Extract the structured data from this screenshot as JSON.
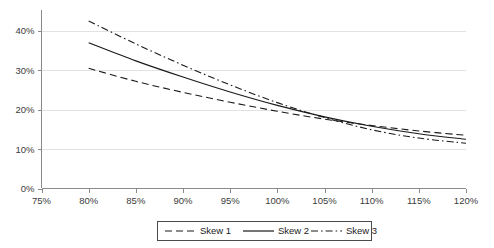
{
  "chart_data": {
    "type": "line",
    "title": "",
    "subtitle": "",
    "xlabel": "",
    "ylabel": "",
    "xlim": [
      75,
      120
    ],
    "ylim": [
      0,
      45
    ],
    "grid": true,
    "legend_position": "bottom",
    "x_tick_labels": [
      "75%",
      "80%",
      "85%",
      "90%",
      "95%",
      "100%",
      "105%",
      "110%",
      "115%",
      "120%"
    ],
    "x_ticks": [
      75,
      80,
      85,
      90,
      95,
      100,
      105,
      110,
      115,
      120
    ],
    "y_tick_labels": [
      "0%",
      "10%",
      "20%",
      "30%",
      "40%"
    ],
    "y_ticks": [
      0,
      10,
      20,
      30,
      40
    ],
    "x": [
      80,
      85,
      90,
      95,
      100,
      105,
      110,
      115,
      120
    ],
    "series": [
      {
        "name": "Skew 1",
        "style": "dashed",
        "color": "#1a1a1a",
        "values": [
          30.5,
          27.2,
          24.4,
          21.9,
          19.6,
          17.6,
          16.0,
          14.6,
          13.5
        ]
      },
      {
        "name": "Skew 2",
        "style": "solid",
        "color": "#1a1a1a",
        "values": [
          37.0,
          32.4,
          28.3,
          24.5,
          21.1,
          18.2,
          15.8,
          13.9,
          12.5
        ]
      },
      {
        "name": "Skew 3",
        "style": "dash-dot",
        "color": "#1a1a1a",
        "values": [
          42.5,
          36.7,
          31.3,
          26.3,
          21.8,
          18.0,
          14.9,
          12.8,
          11.5
        ]
      }
    ],
    "legend_entries": [
      {
        "label": "Skew 1",
        "style": "dashed"
      },
      {
        "label": "Skew 2",
        "style": "solid"
      },
      {
        "label": "Skew 3",
        "style": "dash-dot"
      }
    ]
  },
  "axis": {
    "x_labels": [
      "75%",
      "80%",
      "85%",
      "90%",
      "95%",
      "100%",
      "105%",
      "110%",
      "115%",
      "120%"
    ],
    "y_labels": [
      "0%",
      "10%",
      "20%",
      "30%",
      "40%"
    ]
  },
  "legend": {
    "items": [
      {
        "label": "Skew 1"
      },
      {
        "label": "Skew 2"
      },
      {
        "label": "Skew 3"
      }
    ]
  }
}
